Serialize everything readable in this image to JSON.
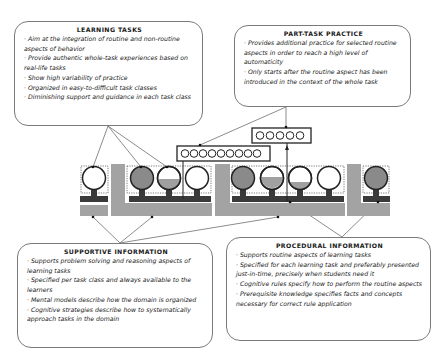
{
  "boxes": {
    "learning_tasks": {
      "title": "LEARNING TASKS",
      "items": [
        "Aim at the integration of routine and non-routine aspects of behavior",
        "Provide authentic whole-task experiences based on real-life tasks",
        "Show high variability of practice",
        "Organized in easy-to-difficult task classes",
        "Diminishing support and guidance in each task class"
      ]
    },
    "part_task_practice": {
      "title": "PART-TASK PRACTICE",
      "items": [
        "Provides additional practice for selected routine aspects in order to reach a high level of automaticity",
        "Only starts after the routine aspect has been introduced in the context of the whole task"
      ]
    },
    "supportive_information": {
      "title": "SUPPORTIVE INFORMATION",
      "items": [
        "Supports problem solving and reasoning aspects of learning tasks",
        "Specified per task class and always available to the learners",
        "Mental models describe how the domain is organized",
        "Cognitive strategies describe how to systematically approach tasks in the domain"
      ]
    },
    "procedural_information": {
      "title": "PROCEDURAL INFORMATION",
      "items": [
        "Supports routine aspects of learning tasks",
        "Specified for each learning task and preferably presented just-in-time, precisely when students need it",
        "Cognitive rules specify how to perform the routine aspects",
        "Prerequisite knowledge specifies facts and concepts necessary for correct rule application"
      ]
    }
  },
  "diagram": {
    "part_task_groups": [
      {
        "circle_count": 9
      },
      {
        "circle_count": 5
      }
    ],
    "task_classes": [
      {
        "fills": [
          0
        ]
      },
      {
        "fills": [
          0.85,
          0.4,
          0
        ]
      },
      {
        "fills": [
          0.85,
          0.55,
          0.25,
          0
        ]
      },
      {
        "fills": [
          0.85
        ]
      }
    ],
    "colors": {
      "gray": "#a3a3a3",
      "dark": "#3a3a3a",
      "line": "#6e6e6e"
    }
  }
}
